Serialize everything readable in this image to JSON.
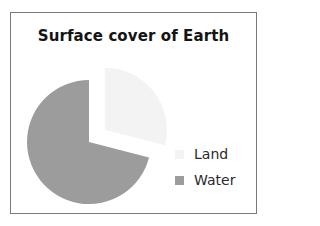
{
  "chart_data": {
    "type": "pie",
    "title": "Surface cover of Earth",
    "categories": [
      "Land",
      "Water"
    ],
    "values": [
      29,
      71
    ],
    "units": "percent (estimated from slice angles)",
    "colors": {
      "Land": "#f3f3f3",
      "Water": "#9c9c9c"
    },
    "exploded": [
      "Land"
    ],
    "start_angle_deg": 0,
    "direction": "clockwise from top: Land first",
    "legend_position": "right-bottom"
  },
  "legend": {
    "items": [
      {
        "label": "Land",
        "color": "#f3f3f3"
      },
      {
        "label": "Water",
        "color": "#9c9c9c"
      }
    ]
  },
  "colors": {
    "border": "#7a7a7a",
    "title": "#141414"
  }
}
